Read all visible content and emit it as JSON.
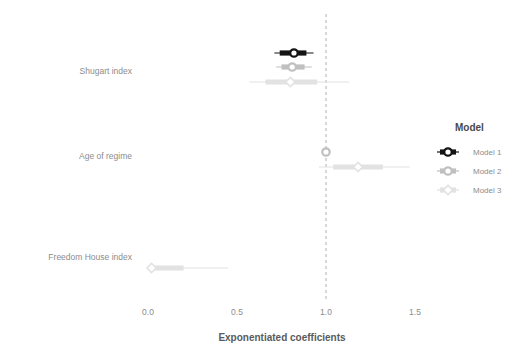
{
  "chart_data": {
    "type": "scatter",
    "plot_kind": "coefficient-forest-plot",
    "title": "",
    "xlabel": "Exponentiated coefficients",
    "ylabel": "",
    "xlim": [
      -0.05,
      1.62
    ],
    "xticks": [
      0.0,
      0.5,
      1.0,
      1.5
    ],
    "xticklabels": [
      "0.0",
      "0.5",
      "1.0",
      "1.5"
    ],
    "grid": false,
    "reference_line": {
      "x": 1.0,
      "style": "dashed",
      "color": "#b0b0b0"
    },
    "categories": [
      "Shugart index",
      "Age of regime",
      "Freedom House index"
    ],
    "legend": {
      "title": "Model",
      "position": "right",
      "entries": [
        {
          "name": "Model 1",
          "color": "#141414",
          "marker": "circle"
        },
        {
          "name": "Model 2",
          "color": "#c0c0c0",
          "marker": "circle"
        },
        {
          "name": "Model 3",
          "color": "#e2e2e2",
          "marker": "diamond"
        }
      ]
    },
    "series": [
      {
        "name": "Model 1",
        "color": "#141414",
        "marker": "circle",
        "points": [
          {
            "category": "Shugart index",
            "estimate": 0.82,
            "inner_low": 0.74,
            "inner_high": 0.89,
            "outer_low": 0.71,
            "outer_high": 0.93
          }
        ]
      },
      {
        "name": "Model 2",
        "color": "#c0c0c0",
        "marker": "circle",
        "points": [
          {
            "category": "Shugart index",
            "estimate": 0.81,
            "inner_low": 0.75,
            "inner_high": 0.88,
            "outer_low": 0.72,
            "outer_high": 0.92
          },
          {
            "category": "Age of regime",
            "estimate": 1.0,
            "inner_low": 0.985,
            "inner_high": 1.015,
            "outer_low": 0.975,
            "outer_high": 1.025
          }
        ]
      },
      {
        "name": "Model 3",
        "color": "#e2e2e2",
        "marker": "diamond",
        "points": [
          {
            "category": "Shugart index",
            "estimate": 0.8,
            "inner_low": 0.66,
            "inner_high": 0.95,
            "outer_low": 0.57,
            "outer_high": 1.13
          },
          {
            "category": "Age of regime",
            "estimate": 1.18,
            "inner_low": 1.04,
            "inner_high": 1.32,
            "outer_low": 0.96,
            "outer_high": 1.47
          },
          {
            "category": "Freedom House index",
            "estimate": 0.02,
            "inner_low": 0.02,
            "inner_high": 0.2,
            "outer_low": 0.02,
            "outer_high": 0.45
          }
        ]
      }
    ]
  }
}
